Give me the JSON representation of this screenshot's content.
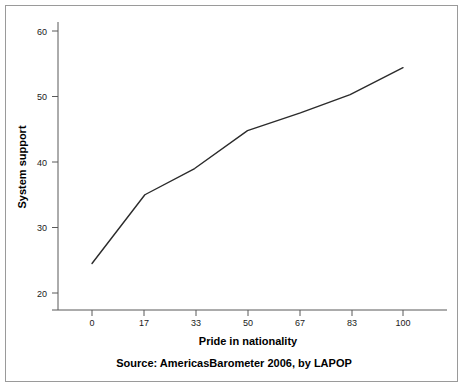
{
  "figure": {
    "border_color": "#9a9a9a",
    "background_color": "#ffffff"
  },
  "chart_data": {
    "type": "line",
    "title": "",
    "subtitle": "",
    "xlabel": "Pride in nationality",
    "ylabel": "System support",
    "x": [
      0,
      17,
      33,
      50,
      67,
      83,
      100
    ],
    "xtick_labels": [
      "0",
      "17",
      "33",
      "50",
      "67",
      "83",
      "100"
    ],
    "ytick_labels": [
      "20",
      "30",
      "40",
      "50",
      "60"
    ],
    "ytick_values": [
      20,
      30,
      40,
      50,
      60
    ],
    "values": [
      24.5,
      35.0,
      39.0,
      44.8,
      47.5,
      50.3,
      54.4
    ],
    "series": [
      {
        "name": "System support",
        "values": [
          24.5,
          35.0,
          39.0,
          44.8,
          47.5,
          50.3,
          54.4
        ],
        "color": "#2b2b2b"
      }
    ],
    "xlim": [
      -9,
      109
    ],
    "ylim": [
      18.5,
      61.5
    ],
    "grid": false,
    "legend": false,
    "legend_position": "none",
    "annotations": [
      "Source: AmericasBarometer 2006, by LAPOP"
    ]
  },
  "caption": {
    "source_note": "Source: AmericasBarometer 2006, by LAPOP"
  }
}
